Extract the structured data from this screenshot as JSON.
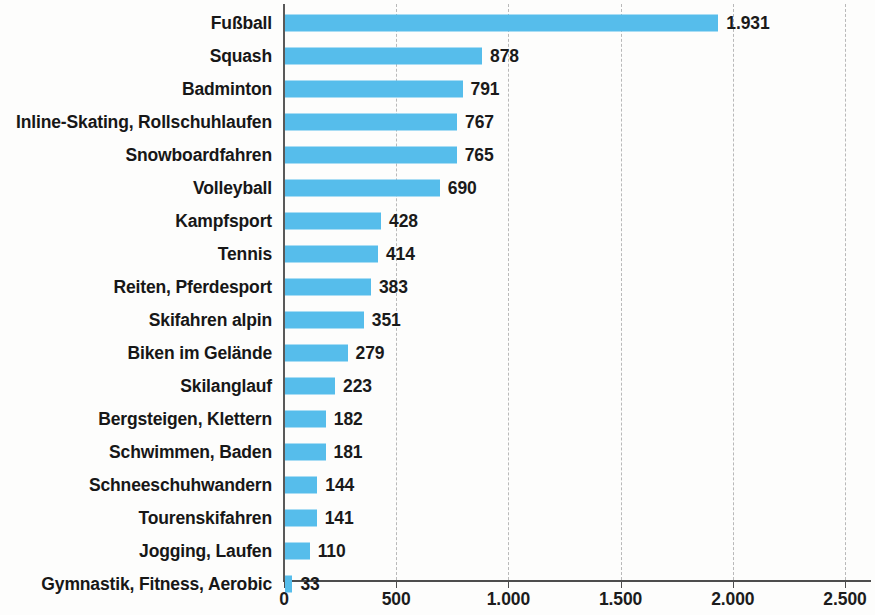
{
  "chart_data": {
    "type": "bar",
    "orientation": "horizontal",
    "title": "",
    "subtitle": "",
    "xlabel": "",
    "ylabel": "",
    "xlim": [
      0,
      2500
    ],
    "grid": true,
    "legend": null,
    "legend_position": "none",
    "bar_color": "#56bdeb",
    "axis_color": "#4d4d4d",
    "gridline_color": "#b9b9b9",
    "label_color": "#171717",
    "x_ticks": [
      0,
      500,
      1000,
      1500,
      2000,
      2500
    ],
    "x_tick_labels": [
      "0",
      "500",
      "1.000",
      "1.500",
      "2.000",
      "2.500"
    ],
    "categories": [
      "Fußball",
      "Squash",
      "Badminton",
      "Inline-Skating, Rollschuhlaufen",
      "Snowboardfahren",
      "Volleyball",
      "Kampfsport",
      "Tennis",
      "Reiten, Pferdesport",
      "Skifahren alpin",
      "Biken im Gelände",
      "Skilanglauf",
      "Bergsteigen, Klettern",
      "Schwimmen, Baden",
      "Schneeschuhwandern",
      "Tourenskifahren",
      "Jogging, Laufen",
      "Gymnastik, Fitness, Aerobic"
    ],
    "values": [
      1931,
      878,
      791,
      767,
      765,
      690,
      428,
      414,
      383,
      351,
      279,
      223,
      182,
      181,
      144,
      141,
      110,
      33
    ],
    "value_labels": [
      "1.931",
      "878",
      "791",
      "767",
      "765",
      "690",
      "428",
      "414",
      "383",
      "351",
      "279",
      "223",
      "182",
      "181",
      "144",
      "141",
      "110",
      "33"
    ]
  }
}
